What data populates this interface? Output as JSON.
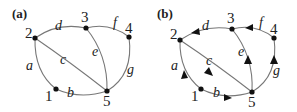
{
  "panels": [
    {
      "id": "a",
      "title": "(a)",
      "directed": false,
      "nodes": [
        {
          "id": "1",
          "label": "1"
        },
        {
          "id": "2",
          "label": "2"
        },
        {
          "id": "3",
          "label": "3"
        },
        {
          "id": "4",
          "label": "4"
        },
        {
          "id": "5",
          "label": "5"
        }
      ],
      "edges": [
        {
          "label": "a",
          "from": "1",
          "to": "2"
        },
        {
          "label": "b",
          "from": "1",
          "to": "5"
        },
        {
          "label": "c",
          "from": "2",
          "to": "5"
        },
        {
          "label": "d",
          "from": "2",
          "to": "3"
        },
        {
          "label": "e",
          "from": "3",
          "to": "5"
        },
        {
          "label": "f",
          "from": "3",
          "to": "4"
        },
        {
          "label": "g",
          "from": "4",
          "to": "5"
        }
      ]
    },
    {
      "id": "b",
      "title": "(b)",
      "directed": true,
      "nodes": [
        {
          "id": "1",
          "label": "1"
        },
        {
          "id": "2",
          "label": "2"
        },
        {
          "id": "3",
          "label": "3"
        },
        {
          "id": "4",
          "label": "4"
        },
        {
          "id": "5",
          "label": "5"
        }
      ],
      "edges": [
        {
          "label": "a",
          "from": "1",
          "to": "2"
        },
        {
          "label": "b",
          "from": "1",
          "to": "5"
        },
        {
          "label": "c",
          "from": "2",
          "to": "5"
        },
        {
          "label": "d",
          "from": "3",
          "to": "2"
        },
        {
          "label": "e",
          "from": "5",
          "to": "3"
        },
        {
          "label": "f",
          "from": "4",
          "to": "3"
        },
        {
          "label": "g",
          "from": "5",
          "to": "4"
        }
      ]
    }
  ]
}
